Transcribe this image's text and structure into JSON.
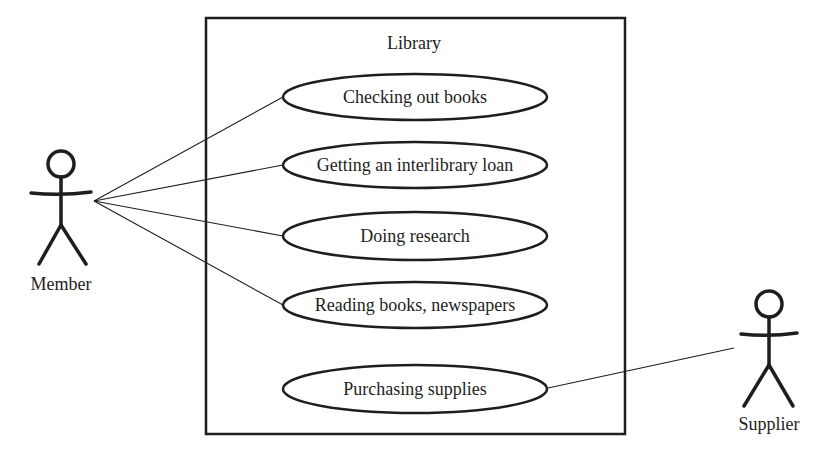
{
  "diagram": {
    "type": "uml-use-case",
    "colors": {
      "stroke": "#1e1e1e",
      "background": "#ffffff"
    },
    "system": {
      "label": "Library",
      "box": {
        "x": 206,
        "y": 18,
        "width": 419,
        "height": 416
      }
    },
    "use_cases": [
      {
        "id": "uc1",
        "label": "Checking out books",
        "cx": 415,
        "cy": 97,
        "rx": 132,
        "ry": 23
      },
      {
        "id": "uc2",
        "label": "Getting an interlibrary loan",
        "cx": 415,
        "cy": 165,
        "rx": 132,
        "ry": 23
      },
      {
        "id": "uc3",
        "label": "Doing research",
        "cx": 415,
        "cy": 236,
        "rx": 132,
        "ry": 24
      },
      {
        "id": "uc4",
        "label": "Reading books, newspapers",
        "cx": 415,
        "cy": 305,
        "rx": 132,
        "ry": 23
      },
      {
        "id": "uc5",
        "label": "Purchasing supplies",
        "cx": 415,
        "cy": 389,
        "rx": 132,
        "ry": 24
      }
    ],
    "actors": [
      {
        "id": "member",
        "label": "Member",
        "x": 61,
        "head_y": 164
      },
      {
        "id": "supplier",
        "label": "Supplier",
        "x": 769,
        "head_y": 304
      }
    ],
    "associations": [
      {
        "from": "member",
        "to": "uc1"
      },
      {
        "from": "member",
        "to": "uc2"
      },
      {
        "from": "member",
        "to": "uc3"
      },
      {
        "from": "member",
        "to": "uc4"
      },
      {
        "from": "supplier",
        "to": "uc5"
      }
    ]
  }
}
